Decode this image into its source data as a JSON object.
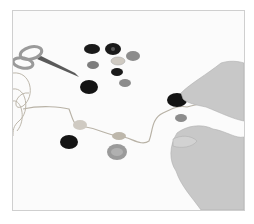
{
  "scene": {
    "description": "Hands threading buttons onto a string, with scissors and loose buttons on a white surface",
    "background_color": "#fbfbfb",
    "frame_border_color": "#cfcfcf",
    "objects": {
      "scissors": {
        "color": "#9a9a9a",
        "blade_color": "#5a5a5a"
      },
      "string": {
        "color": "#b8b2a6"
      },
      "buttons_dark": "#1a1a1a",
      "buttons_grey": "#8c8c8c",
      "buttons_light": "#cfcac2",
      "hands_skin": "#c4c4c4"
    }
  }
}
